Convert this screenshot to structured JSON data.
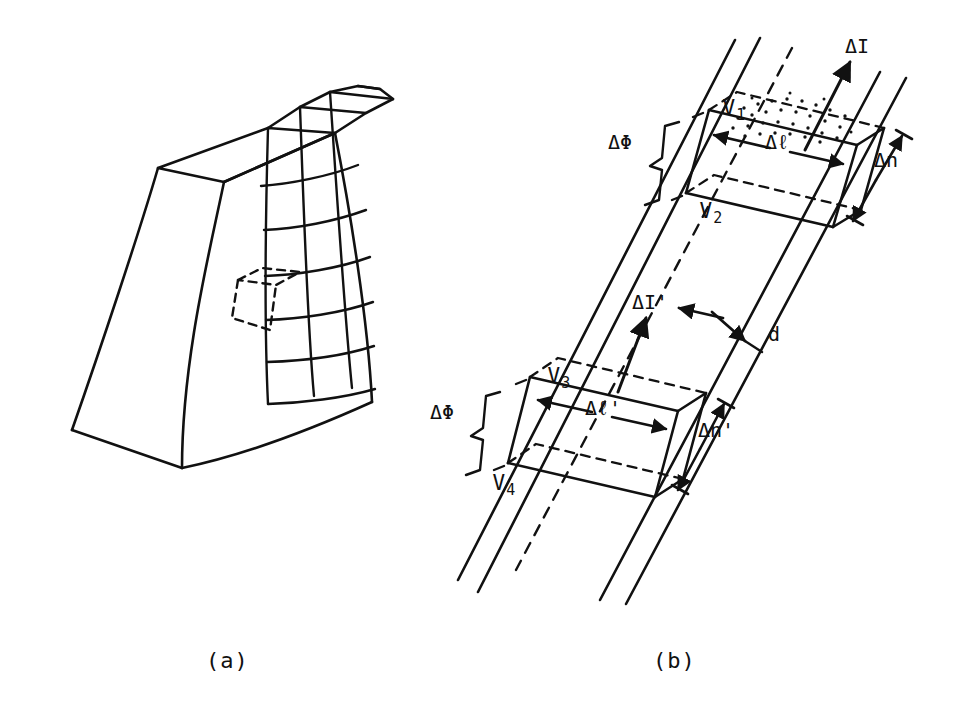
{
  "figure": {
    "background_color": "#ffffff",
    "ink_color": "#111111",
    "panels": [
      {
        "id": "a",
        "caption": "(a)",
        "description": "wedge-shaped solid body with curvilinear grid mesh on its right face and a dashed surface element",
        "grid": {
          "columns": 3,
          "rows": 7
        },
        "dashed_element_label": ""
      },
      {
        "id": "b",
        "caption": "(b)",
        "description": "enlarged current tube with two slab elements bounded by equipotential surfaces",
        "stipple_region_label": ""
      }
    ]
  },
  "labels": {
    "caption_a": "(a)",
    "caption_b": "(b)",
    "v1": "V",
    "v1_sub": "1",
    "v2": "V",
    "v2_sub": "2",
    "v3": "V",
    "v3_sub": "3",
    "v4": "V",
    "v4_sub": "4",
    "delta_phi_top": "ΔΦ",
    "delta_phi_bottom": "ΔΦ",
    "delta_l": "Δℓ",
    "delta_l_prime": "Δℓ'",
    "delta_n": "Δn",
    "delta_n_prime": "Δn'",
    "delta_I": "ΔI",
    "delta_I_prime": "ΔI'",
    "d": "d"
  },
  "icons": {
    "arrow_up": "current-direction-arrow",
    "double_arrow": "dimension-arrow",
    "brace": "curly-brace"
  }
}
